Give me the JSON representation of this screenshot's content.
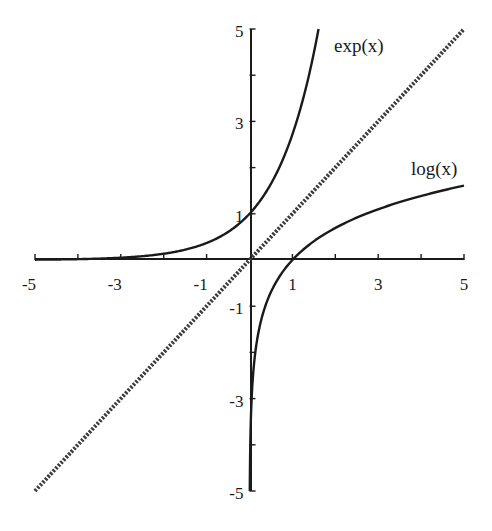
{
  "chart_data": {
    "type": "line",
    "title": "",
    "xlabel": "",
    "ylabel": "",
    "xlim": [
      -5,
      5
    ],
    "ylim": [
      -5,
      5
    ],
    "grid": false,
    "legend": "inline labels",
    "x_ticks": [
      -5,
      -3,
      -1,
      1,
      3,
      5
    ],
    "y_ticks": [
      5,
      3,
      1,
      -1,
      -3,
      -5
    ],
    "x_tick_labels": [
      "-5",
      "-3",
      "-1",
      "1",
      "3",
      "5"
    ],
    "y_tick_labels": [
      "5",
      "3",
      "1",
      "-1",
      "-3",
      "-5"
    ],
    "series": [
      {
        "name": "exp(x)",
        "style": "solid",
        "color": "#1a1a1a",
        "function": "exp(x)",
        "x": [
          -5,
          -3,
          -1,
          0,
          1,
          1.609
        ],
        "y": [
          0.007,
          0.05,
          0.368,
          1,
          2.718,
          5
        ]
      },
      {
        "name": "log(x)",
        "style": "solid",
        "color": "#1a1a1a",
        "function": "log(x)",
        "x": [
          0.007,
          0.05,
          0.368,
          1,
          3,
          5
        ],
        "y": [
          -5,
          -3,
          -1,
          0,
          1.099,
          1.609
        ]
      },
      {
        "name": "y = x",
        "style": "dotted",
        "color": "#333333",
        "function": "x",
        "x": [
          -5,
          5
        ],
        "y": [
          -5,
          5
        ]
      }
    ],
    "annotations": [
      {
        "text": "exp(x)",
        "x": 2.0,
        "y": 4.8
      },
      {
        "text": "log(x)",
        "x": 3.7,
        "y": 1.9
      }
    ]
  },
  "labels": {
    "exp": "exp(x)",
    "log": "log(x)",
    "xt": [
      "-5",
      "-3",
      "-1",
      "1",
      "3",
      "5"
    ],
    "yt": [
      "5",
      "3",
      "1",
      "-1",
      "-3",
      "-5"
    ]
  }
}
